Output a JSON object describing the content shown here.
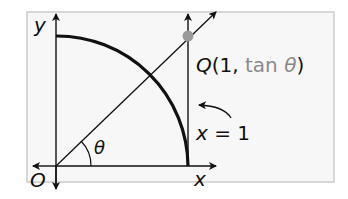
{
  "diagram": {
    "axis_labels": {
      "y": "y",
      "x": "x",
      "origin": "O"
    },
    "angle_label": "θ",
    "point": {
      "name": "Q",
      "open": "(1, ",
      "coord_fn": "tan ",
      "coord_var": "θ",
      "close": ")"
    },
    "line_label": {
      "var": "x",
      "eq": " = 1"
    },
    "colors": {
      "frame_bg": "#f7f7f7",
      "frame_border": "#cccccc",
      "point_fill": "#9a9a9a",
      "tan_text": "#8a8a8a",
      "ink": "#111111"
    }
  }
}
